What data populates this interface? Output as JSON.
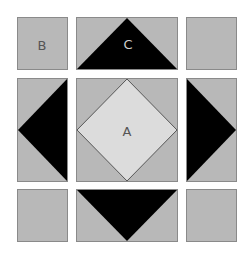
{
  "diagram": {
    "colors": {
      "background": "#ffffff",
      "tile_gray": "#b8b8b8",
      "tile_border": "#8a8a8a",
      "triangle_black": "#000000",
      "diamond_light": "#dcdcdc"
    },
    "labels": {
      "a": "A",
      "b": "B",
      "c": "C"
    },
    "tiles": [
      {
        "pos": "top-left",
        "label": "B",
        "shape": "plain"
      },
      {
        "pos": "top-center",
        "label": "C",
        "shape": "downward-black-triangle"
      },
      {
        "pos": "top-right",
        "label": "",
        "shape": "plain"
      },
      {
        "pos": "middle-left",
        "label": "",
        "shape": "left-pointing-black-triangle"
      },
      {
        "pos": "center",
        "label": "A",
        "shape": "light-diamond"
      },
      {
        "pos": "middle-right",
        "label": "",
        "shape": "right-pointing-black-triangle"
      },
      {
        "pos": "bottom-left",
        "label": "",
        "shape": "plain"
      },
      {
        "pos": "bottom-center",
        "label": "",
        "shape": "downward-black-triangle"
      },
      {
        "pos": "bottom-right",
        "label": "",
        "shape": "plain"
      }
    ]
  }
}
